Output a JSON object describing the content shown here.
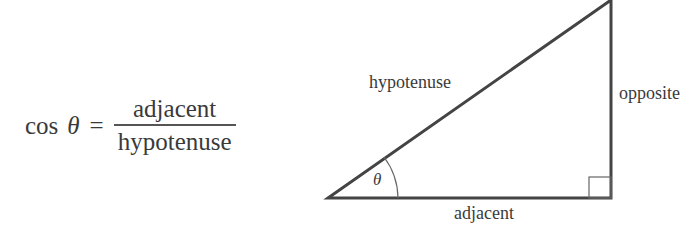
{
  "formula": {
    "lhs_func": "cos",
    "lhs_var": "θ",
    "equals": "=",
    "numerator": "adjacent",
    "denominator": "hypotenuse"
  },
  "triangle": {
    "labels": {
      "hypotenuse": "hypotenuse",
      "opposite": "opposite",
      "adjacent": "adjacent",
      "angle": "θ"
    },
    "stroke_color": "#444444"
  }
}
